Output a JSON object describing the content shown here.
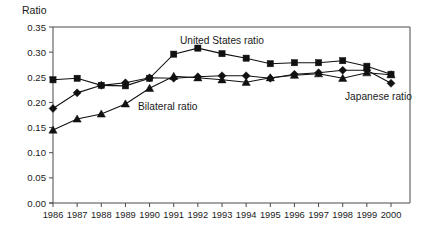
{
  "chart_data": {
    "type": "line",
    "title": "",
    "xlabel": "",
    "ylabel": "Ratio",
    "ylim": [
      0.0,
      0.35
    ],
    "ytick_labels": [
      "0.00",
      "0.05",
      "0.10",
      "0.15",
      "0.20",
      "0.25",
      "0.30",
      "0.35"
    ],
    "ytick_values": [
      0.0,
      0.05,
      0.1,
      0.15,
      0.2,
      0.25,
      0.3,
      0.35
    ],
    "grid": false,
    "legend_position": "inline-annotations",
    "categories": [
      "1986",
      "1987",
      "1988",
      "1989",
      "1990",
      "1991",
      "1992",
      "1993",
      "1994",
      "1995",
      "1996",
      "1997",
      "1998",
      "1999",
      "2000"
    ],
    "x": [
      1986,
      1987,
      1988,
      1989,
      1990,
      1991,
      1992,
      1993,
      1994,
      1995,
      1996,
      1997,
      1998,
      1999,
      2000
    ],
    "series": [
      {
        "name": "United States ratio",
        "marker": "square",
        "values": [
          0.245,
          0.248,
          0.234,
          0.233,
          0.248,
          0.296,
          0.308,
          0.297,
          0.288,
          0.277,
          0.279,
          0.279,
          0.283,
          0.272,
          0.256
        ]
      },
      {
        "name": "Japanese ratio",
        "marker": "diamond",
        "values": [
          0.188,
          0.219,
          0.234,
          0.239,
          0.249,
          0.248,
          0.251,
          0.253,
          0.253,
          0.248,
          0.256,
          0.259,
          0.264,
          0.264,
          0.238
        ]
      },
      {
        "name": "Bilateral ratio",
        "marker": "triangle",
        "values": [
          0.145,
          0.167,
          0.177,
          0.197,
          0.228,
          0.252,
          0.249,
          0.245,
          0.24,
          0.249,
          0.254,
          0.257,
          0.248,
          0.259,
          0.255
        ]
      }
    ],
    "annotations": [
      {
        "text": "United States ratio",
        "series": "United States ratio",
        "x_px": 180,
        "y_px": 44
      },
      {
        "text": "Bilateral ratio",
        "series": "Bilateral ratio",
        "x_px": 138,
        "y_px": 110
      },
      {
        "text": "Japanese ratio",
        "series": "Japanese ratio",
        "x_px": 345,
        "y_px": 100
      }
    ],
    "colors": {
      "series": "#111111",
      "axis": "#4a4a4a",
      "background": "#ffffff",
      "text": "#1a1a1a"
    }
  }
}
